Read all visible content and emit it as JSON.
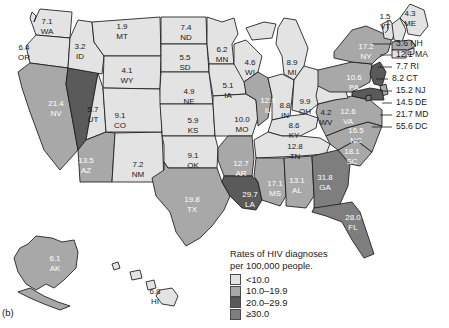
{
  "figure": {
    "label": "(b)"
  },
  "legend": {
    "title_line1": "Rates of HIV diagnoses",
    "title_line2": "per 100,000 people.",
    "bins": [
      {
        "label": "<10.0",
        "color": "#e3e3e3"
      },
      {
        "label": "10.0–19.9",
        "color": "#a8a8a8"
      },
      {
        "label": "20.0–29.9",
        "color": "#5a5a5a"
      },
      {
        "label": "≥30.0",
        "color": "#7e7e7e"
      }
    ]
  },
  "chart_data": {
    "type": "heatmap",
    "title": "Rates of HIV diagnoses per 100,000 people.",
    "xlabel": "",
    "ylabel": "",
    "unit": "per 100,000 people",
    "legend_position": "bottom-right",
    "bins": [
      {
        "label": "<10.0",
        "min": 0,
        "max": 9.99,
        "color": "#e3e3e3"
      },
      {
        "label": "10.0–19.9",
        "min": 10.0,
        "max": 19.9,
        "color": "#a8a8a8"
      },
      {
        "label": "20.0–29.9",
        "min": 20.0,
        "max": 29.9,
        "color": "#5a5a5a"
      },
      {
        "label": "≥30.0",
        "min": 30.0,
        "max": null,
        "color": "#7e7e7e"
      }
    ],
    "categories": [
      "WA",
      "OR",
      "CA",
      "NV",
      "ID",
      "MT",
      "WY",
      "UT",
      "AZ",
      "NM",
      "CO",
      "ND",
      "SD",
      "NE",
      "KS",
      "OK",
      "TX",
      "MN",
      "IA",
      "MO",
      "AR",
      "LA",
      "WI",
      "IL",
      "MI",
      "IN",
      "OH",
      "KY",
      "TN",
      "MS",
      "AL",
      "GA",
      "FL",
      "SC",
      "NC",
      "VA",
      "WV",
      "PA",
      "NY",
      "VT",
      "ME",
      "NH",
      "MA",
      "RI",
      "CT",
      "NJ",
      "DE",
      "MD",
      "DC",
      "AK",
      "HI"
    ],
    "values": [
      7.1,
      6.4,
      15.2,
      21.4,
      3.2,
      1.9,
      4.1,
      5.7,
      13.5,
      7.2,
      9.1,
      7.4,
      5.5,
      4.9,
      5.9,
      9.1,
      19.8,
      6.2,
      5.1,
      10.0,
      12.7,
      29.7,
      4.6,
      12.9,
      8.9,
      8.8,
      9.9,
      8.6,
      12.8,
      17.1,
      13.1,
      31.8,
      28.0,
      18.1,
      16.5,
      12.6,
      4.2,
      10.6,
      17.2,
      1.5,
      4.3,
      3.6,
      12.1,
      7.7,
      8.2,
      15.2,
      14.5,
      21.7,
      55.6,
      6.1,
      6.8
    ]
  },
  "states": [
    {
      "code": "WA",
      "value": "7.1",
      "label_x": 47,
      "label_y": 22,
      "tone": "l"
    },
    {
      "code": "OR",
      "value": "6.4",
      "label_x": 24,
      "label_y": 48,
      "tone": "l"
    },
    {
      "code": "CA",
      "value": "15.2",
      "label_x": 24,
      "label_y": 124,
      "tone": "d"
    },
    {
      "code": "NV",
      "value": "21.4",
      "label_x": 56,
      "label_y": 104,
      "tone": "d"
    },
    {
      "code": "ID",
      "value": "3.2",
      "label_x": 80,
      "label_y": 47,
      "tone": "l"
    },
    {
      "code": "MT",
      "value": "1.9",
      "label_x": 122,
      "label_y": 27,
      "tone": "l"
    },
    {
      "code": "WY",
      "value": "4.1",
      "label_x": 127,
      "label_y": 71,
      "tone": "l"
    },
    {
      "code": "UT",
      "value": "5.7",
      "label_x": 93,
      "label_y": 110,
      "tone": "l"
    },
    {
      "code": "AZ",
      "value": "13.5",
      "label_x": 86,
      "label_y": 161,
      "tone": "d"
    },
    {
      "code": "NM",
      "value": "7.2",
      "label_x": 138,
      "label_y": 165,
      "tone": "l"
    },
    {
      "code": "CO",
      "value": "9.1",
      "label_x": 120,
      "label_y": 116,
      "tone": "l"
    },
    {
      "code": "ND",
      "value": "7.4",
      "label_x": 186,
      "label_y": 28,
      "tone": "l"
    },
    {
      "code": "SD",
      "value": "5.5",
      "label_x": 185,
      "label_y": 58,
      "tone": "l"
    },
    {
      "code": "NE",
      "value": "4.9",
      "label_x": 189,
      "label_y": 92,
      "tone": "l"
    },
    {
      "code": "KS",
      "value": "5.9",
      "label_x": 193,
      "label_y": 121,
      "tone": "l"
    },
    {
      "code": "OK",
      "value": "9.1",
      "label_x": 193,
      "label_y": 156,
      "tone": "l"
    },
    {
      "code": "TX",
      "value": "19.8",
      "label_x": 192,
      "label_y": 200,
      "tone": "d"
    },
    {
      "code": "MN",
      "value": "6.2",
      "label_x": 222,
      "label_y": 50,
      "tone": "l"
    },
    {
      "code": "IA",
      "value": "5.1",
      "label_x": 228,
      "label_y": 86,
      "tone": "l"
    },
    {
      "code": "MO",
      "value": "10.0",
      "label_x": 242,
      "label_y": 120,
      "tone": "l"
    },
    {
      "code": "AR",
      "value": "12.7",
      "label_x": 241,
      "label_y": 164,
      "tone": "d"
    },
    {
      "code": "LA",
      "value": "29.7",
      "label_x": 250,
      "label_y": 195,
      "tone": "d"
    },
    {
      "code": "WI",
      "value": "4.6",
      "label_x": 250,
      "label_y": 63,
      "tone": "l"
    },
    {
      "code": "IL",
      "value": "12.9",
      "label_x": 268,
      "label_y": 101,
      "tone": "d"
    },
    {
      "code": "MI",
      "value": "8.9",
      "label_x": 292,
      "label_y": 63,
      "tone": "l"
    },
    {
      "code": "IN",
      "value": "8.8",
      "label_x": 285,
      "label_y": 106,
      "tone": "l"
    },
    {
      "code": "OH",
      "value": "9.9",
      "label_x": 305,
      "label_y": 102,
      "tone": "l"
    },
    {
      "code": "KY",
      "value": "8.6",
      "label_x": 294,
      "label_y": 126,
      "tone": "l"
    },
    {
      "code": "TN",
      "value": "12.8",
      "label_x": 295,
      "label_y": 147,
      "tone": "l"
    },
    {
      "code": "MS",
      "value": "17.1",
      "label_x": 275,
      "label_y": 184,
      "tone": "d"
    },
    {
      "code": "AL",
      "value": "13.1",
      "label_x": 297,
      "label_y": 181,
      "tone": "d"
    },
    {
      "code": "GA",
      "value": "31.8",
      "label_x": 325,
      "label_y": 178,
      "tone": "d"
    },
    {
      "code": "FL",
      "value": "28.0",
      "label_x": 353,
      "label_y": 218,
      "tone": "d"
    },
    {
      "code": "SC",
      "value": "18.1",
      "label_x": 352,
      "label_y": 152,
      "tone": "d"
    },
    {
      "code": "NC",
      "value": "16.5",
      "label_x": 356,
      "label_y": 131,
      "tone": "d"
    },
    {
      "code": "VA",
      "value": "12.6",
      "label_x": 348,
      "label_y": 112,
      "tone": "d"
    },
    {
      "code": "WV",
      "value": "4.2",
      "label_x": 326,
      "label_y": 113,
      "tone": "l"
    },
    {
      "code": "PA",
      "value": "10.6",
      "label_x": 354,
      "label_y": 78,
      "tone": "d"
    },
    {
      "code": "NY",
      "value": "17.2",
      "label_x": 366,
      "label_y": 47,
      "tone": "d"
    },
    {
      "code": "VT",
      "value": "1.5",
      "label_x": 385,
      "label_y": 17,
      "tone": "l"
    },
    {
      "code": "ME",
      "value": "4.3",
      "label_x": 410,
      "label_y": 14,
      "tone": "l"
    }
  ],
  "callouts": [
    {
      "text": "3.6 NH",
      "x": 396,
      "y": 44
    },
    {
      "text": "12.1 MA",
      "x": 396,
      "y": 55
    },
    {
      "text": "7.7 RI",
      "x": 396,
      "y": 67
    },
    {
      "text": "8.2 CT",
      "x": 392,
      "y": 79
    },
    {
      "text": "15.2 NJ",
      "x": 396,
      "y": 91
    },
    {
      "text": "14.5 DE",
      "x": 396,
      "y": 103
    },
    {
      "text": "21.7 MD",
      "x": 396,
      "y": 115
    },
    {
      "text": "55.6 DC",
      "x": 396,
      "y": 127
    }
  ],
  "insets": [
    {
      "code": "AK",
      "value": "6.1",
      "label_x": 55,
      "label_y": 259,
      "tone": "d"
    },
    {
      "code": "HI",
      "value": "6.8",
      "label_x": 155,
      "label_y": 292,
      "tone": "l"
    }
  ]
}
